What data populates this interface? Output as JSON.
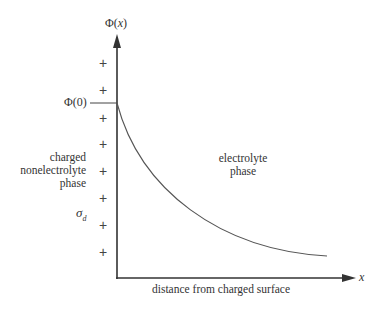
{
  "diagram": {
    "y_axis_label_prefix": "Φ(",
    "y_axis_label_var": "x",
    "y_axis_label_suffix": ")",
    "phi0_label": "Φ(0)",
    "x_axis_label": "x",
    "x_axis_caption": "distance from charged surface",
    "left_region": {
      "line1": "charged",
      "line2": "nonelectrolyte",
      "line3": "phase"
    },
    "right_region": {
      "line1": "electrolyte",
      "line2": "phase"
    },
    "sigma_label": "σ",
    "sigma_subscript": "d",
    "plus_symbol": "+",
    "plus_count": 8,
    "colors": {
      "axis": "#333333",
      "curve": "#555555",
      "text": "#333333"
    }
  }
}
